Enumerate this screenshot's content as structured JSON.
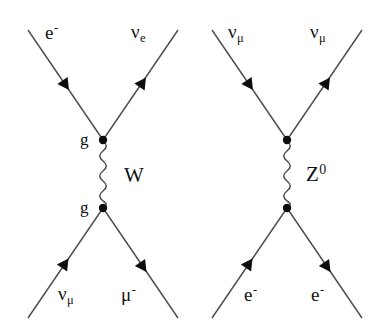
{
  "figure": {
    "background_color": "#ffffff",
    "line_color": "#4a4a4a",
    "text_color": "#111111",
    "vertex_color": "#000000"
  },
  "diagrams": [
    {
      "id": "left",
      "name": "charged-current-w-exchange",
      "propagator": {
        "label": "W",
        "label_base": "W",
        "label_sup": "",
        "type": "wavy"
      },
      "vertices": [
        {
          "id": "top",
          "label": "g",
          "x": 103,
          "y": 140
        },
        {
          "id": "bottom",
          "label": "g",
          "x": 103,
          "y": 208
        }
      ],
      "legs": [
        {
          "id": "top-left",
          "label_base": "e",
          "label_sup": "-",
          "label_sub": "",
          "direction": "incoming",
          "arrow": "toward-vertex"
        },
        {
          "id": "top-right",
          "label_base": "ν",
          "label_sup": "",
          "label_sub": "e",
          "direction": "outgoing",
          "arrow": "away-from-vertex"
        },
        {
          "id": "bottom-left",
          "label_base": "ν",
          "label_sup": "",
          "label_sub": "μ",
          "direction": "incoming",
          "arrow": "toward-vertex"
        },
        {
          "id": "bottom-right",
          "label_base": "μ",
          "label_sup": "-",
          "label_sub": "",
          "direction": "outgoing",
          "arrow": "away-from-vertex"
        }
      ]
    },
    {
      "id": "right",
      "name": "neutral-current-z-exchange",
      "propagator": {
        "label": "Z0",
        "label_base": "Z",
        "label_sup": "0",
        "type": "wavy"
      },
      "vertices": [
        {
          "id": "top",
          "label": "",
          "x": 287,
          "y": 140
        },
        {
          "id": "bottom",
          "label": "",
          "x": 287,
          "y": 208
        }
      ],
      "legs": [
        {
          "id": "top-left",
          "label_base": "ν",
          "label_sup": "",
          "label_sub": "μ",
          "direction": "incoming",
          "arrow": "toward-vertex"
        },
        {
          "id": "top-right",
          "label_base": "ν",
          "label_sup": "",
          "label_sub": "μ",
          "direction": "outgoing",
          "arrow": "away-from-vertex"
        },
        {
          "id": "bottom-left",
          "label_base": "e",
          "label_sup": "-",
          "label_sub": "",
          "direction": "incoming",
          "arrow": "toward-vertex"
        },
        {
          "id": "bottom-right",
          "label_base": "e",
          "label_sup": "-",
          "label_sub": "",
          "direction": "outgoing",
          "arrow": "away-from-vertex"
        }
      ]
    }
  ]
}
